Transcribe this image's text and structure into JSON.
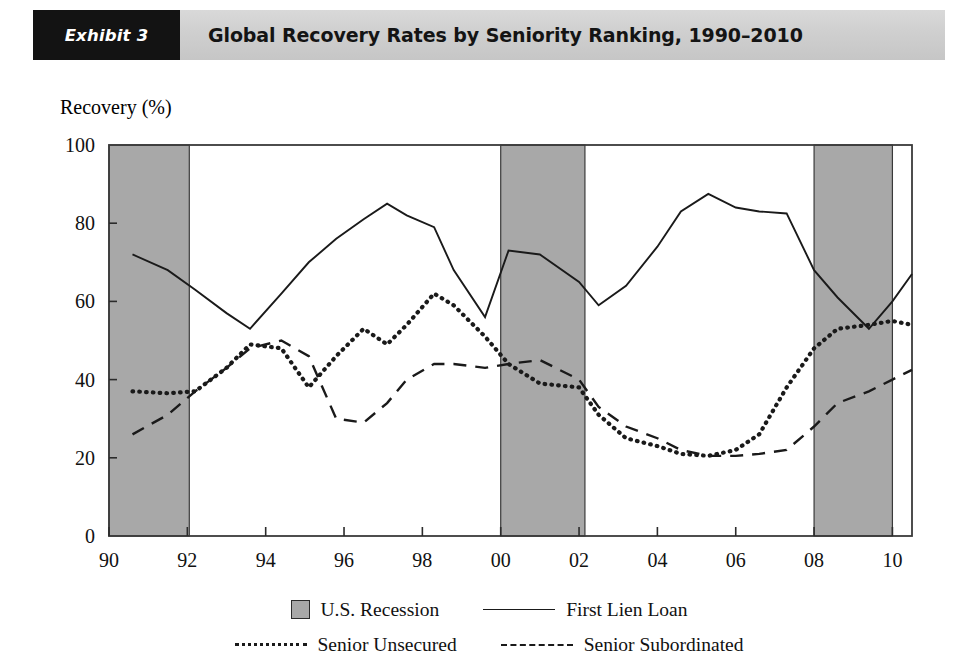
{
  "header": {
    "tag": "Exhibit 3",
    "title": "Global Recovery Rates by Seniority Ranking, 1990–2010"
  },
  "chart_data": {
    "type": "line",
    "title": "Global Recovery Rates by Seniority Ranking, 1990–2010",
    "ylabel": "Recovery (%)",
    "xlabel": "",
    "ylim": [
      0,
      100
    ],
    "xlim": [
      1990,
      2010.5
    ],
    "yticks": [
      0,
      20,
      40,
      60,
      80,
      100
    ],
    "xticks": [
      1990,
      1992,
      1994,
      1996,
      1998,
      2000,
      2002,
      2004,
      2006,
      2008,
      2010
    ],
    "xticklabels": [
      "90",
      "92",
      "94",
      "96",
      "98",
      "00",
      "02",
      "04",
      "06",
      "08",
      "10"
    ],
    "grid": false,
    "legend_position": "below",
    "x": [
      1990.6,
      1991.5,
      1992.2,
      1993.0,
      1993.6,
      1994.4,
      1995.1,
      1995.8,
      1996.5,
      1997.1,
      1997.6,
      1998.3,
      1998.8,
      1999.6,
      2000.2,
      2001.0,
      2002.0,
      2002.5,
      2003.2,
      2004.0,
      2004.6,
      2005.3,
      2006.0,
      2006.6,
      2007.3,
      2008.0,
      2008.6,
      2009.4,
      2010.0,
      2010.5
    ],
    "series": [
      {
        "name": "First Lien Loan",
        "style": "solid",
        "values": [
          72,
          68,
          63,
          57,
          53,
          62,
          70,
          76,
          81,
          85,
          82,
          79,
          68,
          56,
          73,
          72,
          65,
          59,
          64,
          74,
          83,
          87.5,
          84,
          83,
          82.5,
          68,
          61,
          53,
          60,
          67
        ]
      },
      {
        "name": "Senior Unsecured",
        "style": "dotted",
        "values": [
          37,
          36.5,
          37,
          43,
          49,
          48,
          38,
          46,
          53,
          49,
          54,
          62,
          59,
          51,
          44,
          39,
          38,
          31,
          25,
          23,
          21,
          20.5,
          22,
          26,
          38,
          48,
          53,
          54,
          55,
          54
        ],
        "values_tail": [
          47,
          42,
          33,
          26,
          24,
          24.5,
          27,
          33,
          38,
          44,
          48
        ]
      },
      {
        "name": "Senior Subordinated",
        "style": "dashed",
        "values": [
          26,
          31,
          37,
          43,
          48,
          50,
          46,
          30,
          29,
          34,
          40,
          44,
          44,
          43,
          44,
          45,
          40,
          33,
          28,
          25,
          22,
          20.5,
          20.5,
          21,
          22,
          28,
          34,
          37,
          40,
          42.5
        ],
        "values_tail": [
          43,
          43,
          42,
          37,
          31,
          42,
          38,
          26,
          34,
          44,
          55,
          50,
          40,
          31,
          24,
          23,
          23,
          22.5,
          25,
          28,
          32
        ]
      }
    ],
    "shaded_regions": [
      {
        "label": "U.S. Recession",
        "start": 1990.0,
        "end": 1992.05
      },
      {
        "label": "U.S. Recession",
        "start": 2000.0,
        "end": 2002.15
      },
      {
        "label": "U.S. Recession",
        "start": 2008.0,
        "end": 2010.0
      }
    ],
    "shade_color": "#a8a8a8",
    "line_color": "#1a1a1a"
  },
  "legend": {
    "rows": [
      [
        {
          "label": "U.S. Recession",
          "style": "box"
        },
        {
          "label": "First Lien Loan",
          "style": "solid"
        }
      ],
      [
        {
          "label": "Senior Unsecured",
          "style": "dotted"
        },
        {
          "label": "Senior Subordinated",
          "style": "dashed"
        }
      ]
    ]
  }
}
